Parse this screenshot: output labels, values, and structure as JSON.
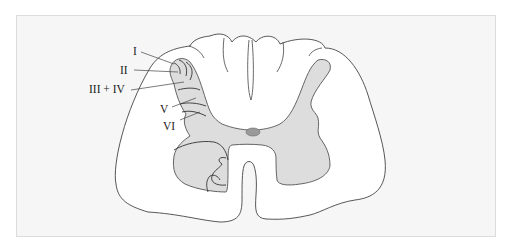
{
  "figure": {
    "colors": {
      "background": "#f6f6f6",
      "frame_border": "#dcdcdc",
      "white_matter": "#ffffff",
      "gray_matter": "#dddddd",
      "central_canal": "#9a9a9a",
      "outline": "#444444"
    },
    "labels": [
      {
        "id": "lamina-1",
        "text": "I"
      },
      {
        "id": "lamina-2",
        "text": "II"
      },
      {
        "id": "lamina-3-4",
        "text": "III + IV"
      },
      {
        "id": "lamina-5",
        "text": "V"
      },
      {
        "id": "lamina-6",
        "text": "VI"
      }
    ]
  }
}
